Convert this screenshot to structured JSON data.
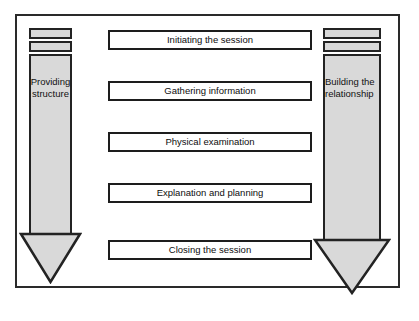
{
  "diagram": {
    "frame": {
      "border_color": "#2a2a2a",
      "background": "#ffffff"
    },
    "colors": {
      "arrow_fill": "#d9d9d9",
      "arrow_stroke": "#232323",
      "box_fill": "#ffffff",
      "box_stroke": "#1d1d1d",
      "text": "#0d0d0d"
    },
    "steps": [
      {
        "label": "Initiating the session"
      },
      {
        "label": "Gathering information"
      },
      {
        "label": "Physical examination"
      },
      {
        "label": "Explanation and planning"
      },
      {
        "label": "Closing the session"
      }
    ],
    "arrows": {
      "left": {
        "label_line1": "Providing",
        "label_line2": "structure",
        "direction": "down",
        "cap_bars": 2
      },
      "right": {
        "label_line1": "Building the",
        "label_line2": "relationship",
        "direction": "down",
        "cap_bars": 2
      }
    }
  }
}
